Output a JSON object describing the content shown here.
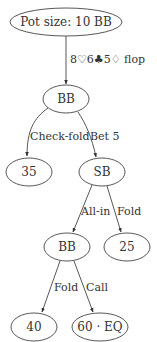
{
  "diagram": {
    "type": "game-tree",
    "nodes": [
      {
        "id": "root",
        "label": "Pot size: 10 BB"
      },
      {
        "id": "bb1",
        "label": "BB"
      },
      {
        "id": "t35",
        "label": "35"
      },
      {
        "id": "sb",
        "label": "SB"
      },
      {
        "id": "bb2",
        "label": "BB"
      },
      {
        "id": "t25",
        "label": "25"
      },
      {
        "id": "t40",
        "label": "40"
      },
      {
        "id": "t60",
        "label": "60 · EQ"
      }
    ],
    "edges": [
      {
        "from": "root",
        "to": "bb1",
        "label": "8♡6♣5♢ flop"
      },
      {
        "from": "bb1",
        "to": "t35",
        "label": "Check-fold"
      },
      {
        "from": "bb1",
        "to": "sb",
        "label": "Bet 5"
      },
      {
        "from": "sb",
        "to": "bb2",
        "label": "All-in"
      },
      {
        "from": "sb",
        "to": "t25",
        "label": "Fold"
      },
      {
        "from": "bb2",
        "to": "t40",
        "label": "Fold"
      },
      {
        "from": "bb2",
        "to": "t60",
        "label": "Call"
      }
    ]
  }
}
